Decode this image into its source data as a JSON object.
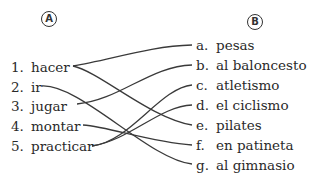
{
  "column_a": {
    "label": "A",
    "items": [
      {
        "num": "1.",
        "text": "hacer"
      },
      {
        "num": "2.",
        "text": "ir"
      },
      {
        "num": "3.",
        "text": "jugar"
      },
      {
        "num": "4.",
        "text": "montar"
      },
      {
        "num": "5.",
        "text": "practicar"
      }
    ]
  },
  "column_b": {
    "label": "B",
    "items": [
      {
        "letter": "a.",
        "text": "pesas"
      },
      {
        "letter": "b.",
        "text": "al baloncesto"
      },
      {
        "letter": "c.",
        "text": "atletismo"
      },
      {
        "letter": "d.",
        "text": "el ciclismo"
      },
      {
        "letter": "e.",
        "text": "pilates"
      },
      {
        "letter": "f.",
        "text": "en patineta"
      },
      {
        "letter": "g.",
        "text": "al gimnasio"
      }
    ]
  },
  "connections": [
    {
      "from": "1",
      "to": "a"
    },
    {
      "from": "1",
      "to": "e"
    },
    {
      "from": "2",
      "to": "g"
    },
    {
      "from": "3",
      "to": "b"
    },
    {
      "from": "4",
      "to": "f"
    },
    {
      "from": "5",
      "to": "c"
    },
    {
      "from": "5",
      "to": "d"
    }
  ]
}
